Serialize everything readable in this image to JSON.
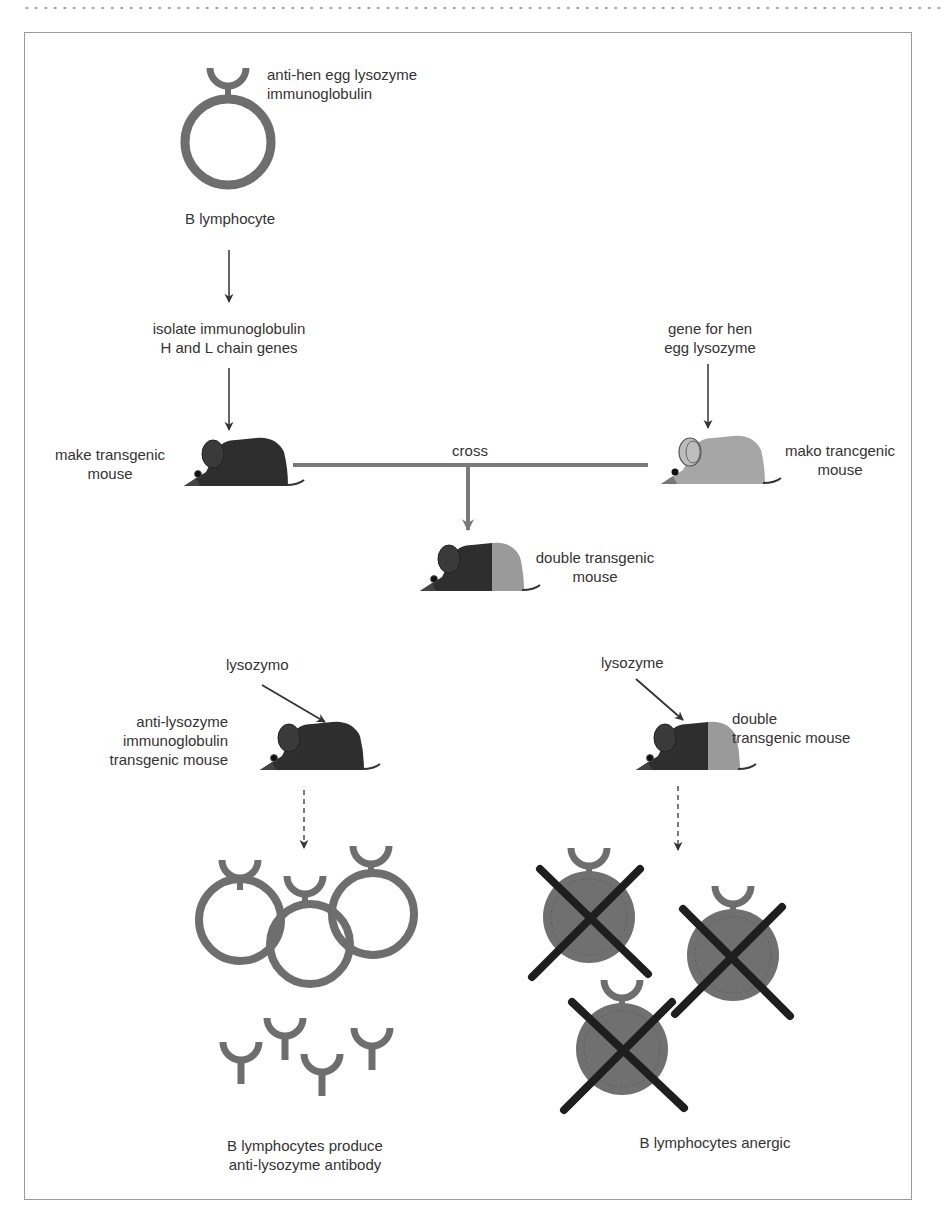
{
  "figure": {
    "top_cell": {
      "receptor_label": "anti-hen egg lysozyme immunoglobulin",
      "receptor_label_line1": "anti-hen egg lysozyme",
      "receptor_label_line2": "immunoglobulin",
      "cell_label": "B lymphocyte"
    },
    "step_isolate": {
      "line1": "isolate immunoglobulin",
      "line2": "H and L chain genes"
    },
    "step_gene": {
      "line1": "gene for hen",
      "line2": "egg lysozyme"
    },
    "left_mouse": {
      "line1": "make transgenic",
      "line2": "mouse"
    },
    "right_mouse": {
      "line1": "mako trancgenic",
      "line2": "mouse"
    },
    "cross_label": "cross",
    "double_mouse": {
      "line1": "double transgenic",
      "line2": "mouse"
    },
    "left_experiment": {
      "stimulus": "lysozymo",
      "mouse_line1": "anti-lysozyme",
      "mouse_line2": "immunoglobulin",
      "mouse_line3": "transgenic mouse",
      "result_line1": "B lymphocytes produce",
      "result_line2": "anti-lysozyme antibody"
    },
    "right_experiment": {
      "stimulus": "lysozyme",
      "mouse_line1": "double",
      "mouse_line2": "transgenic mouse",
      "result_line1": "B lymphocytes anergic"
    },
    "colors": {
      "cell_ring": "#6e6e6e",
      "anergic_fill": "#707070",
      "cross_mark": "#1e1e1e",
      "mouse_dark": "#2e2e2e",
      "mouse_light": "#9a9a9a",
      "arrow": "#333333",
      "cross_line": "#7a7a7a"
    }
  }
}
